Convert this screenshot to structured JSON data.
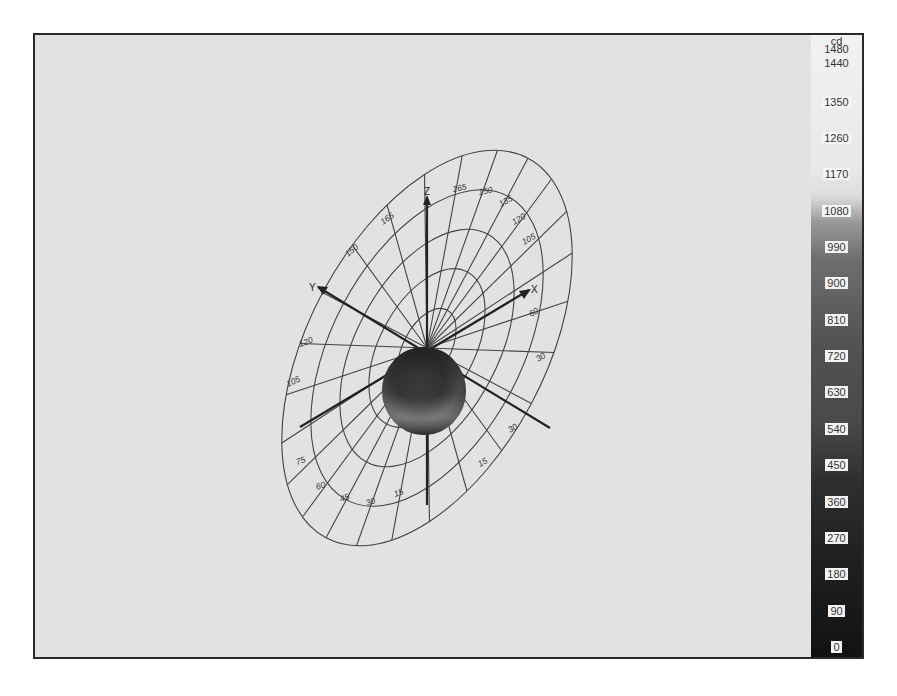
{
  "chart_data": {
    "type": "polar-3d-luminous-intensity",
    "title": "",
    "colorbar": {
      "unit": "cd",
      "min": 0,
      "max": 1480,
      "ticks": [
        1480,
        1440,
        1350,
        1260,
        1170,
        1080,
        990,
        900,
        810,
        720,
        630,
        540,
        450,
        360,
        270,
        180,
        90,
        0
      ],
      "colormap": "grayscale-dark-to-light"
    },
    "axes": {
      "labels": [
        "X",
        "Y",
        "Z"
      ]
    },
    "polar_grid": {
      "angle_labels_upper": [
        "165",
        "150",
        "135",
        "120",
        "105"
      ],
      "angle_labels_top_right": [
        "165",
        "150",
        "135",
        "120",
        "105",
        "75"
      ],
      "angle_labels_right": [
        "60",
        "30"
      ],
      "angle_labels_lower": [
        "75",
        "60",
        "45",
        "30",
        "15",
        "0"
      ],
      "rings": 5
    },
    "body": {
      "shape": "sphere",
      "description": "luminous intensity solid"
    }
  }
}
